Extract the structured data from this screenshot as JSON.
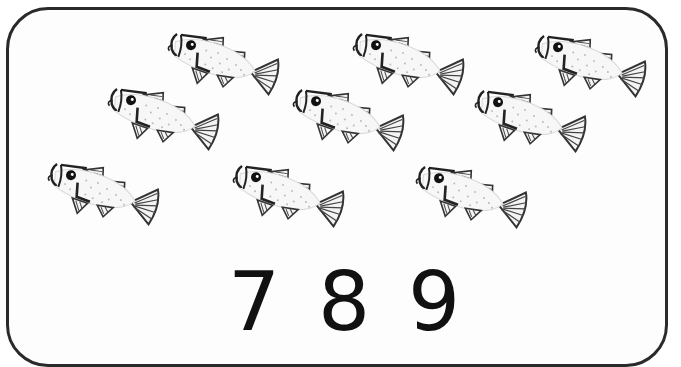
{
  "card": {
    "border_color": "#2a2a2a"
  },
  "fish": {
    "count": 9,
    "icon": "fish-icon",
    "positions": [
      {
        "x": 160,
        "y": 30
      },
      {
        "x": 345,
        "y": 30
      },
      {
        "x": 527,
        "y": 32
      },
      {
        "x": 100,
        "y": 85
      },
      {
        "x": 285,
        "y": 86
      },
      {
        "x": 467,
        "y": 87
      },
      {
        "x": 40,
        "y": 160
      },
      {
        "x": 225,
        "y": 162
      },
      {
        "x": 408,
        "y": 163
      }
    ]
  },
  "numerals": {
    "options": [
      "7",
      "8",
      "9"
    ],
    "positions": [
      228,
      318,
      408
    ]
  }
}
